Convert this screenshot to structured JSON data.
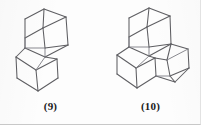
{
  "figure": {
    "kind": "chemical-structure-figure",
    "background_color": "#fdfdfd",
    "line_color": "#5e5e62",
    "label_color": "#1b1b1b",
    "structures": [
      {
        "id": "structure-9",
        "label": "(9)",
        "name": "diamondoid cage hydrocarbon, two fused adamantane units",
        "cage_count": 2,
        "arrangement": "vertically stacked, offset right-over-left"
      },
      {
        "id": "structure-10",
        "label": "(10)",
        "name": "diamondoid cage hydrocarbon, three fused adamantane units",
        "cage_count": 3,
        "arrangement": "branched triangular cluster"
      }
    ]
  }
}
